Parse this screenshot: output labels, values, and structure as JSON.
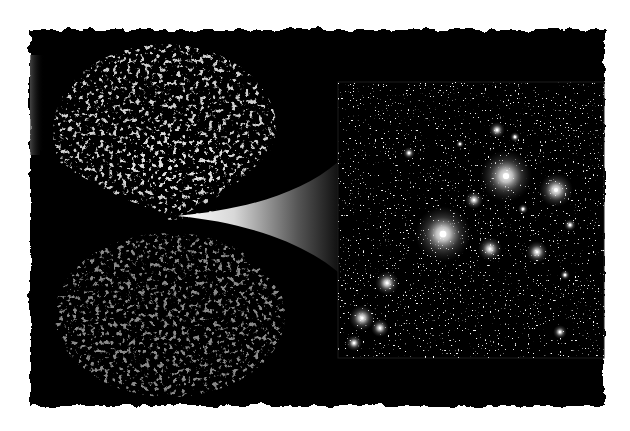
{
  "colors": {
    "page_background": "#ffffff",
    "panel_background": "#000000",
    "cluster_frame": "#1a1a1a",
    "filament": "#bdbdbd",
    "galaxy_glow": "#ffffff",
    "cone_bright": "#ffffff",
    "cone_dark": "#111111"
  },
  "panel": {
    "description": "Torn-edge black panel",
    "bounds": [
      28,
      28,
      606,
      408
    ]
  },
  "survey_wedges": {
    "description": "Galaxy redshift survey slices (two lobes of cosmic web filaments)",
    "upper_lobe": {
      "cx": 165,
      "cy": 140,
      "rx": 120,
      "ry": 90
    },
    "lower_lobe": {
      "cx": 165,
      "cy": 320,
      "rx": 120,
      "ry": 85
    },
    "vertex": [
      178,
      216
    ]
  },
  "zoom_cone": {
    "description": "White-to-black gradient cone linking survey vertex to cluster inset",
    "tip": [
      178,
      216
    ],
    "top_end": [
      335,
      166
    ],
    "bottom_end": [
      335,
      270
    ]
  },
  "cluster_inset": {
    "description": "Galaxy cluster image",
    "bounds": [
      338,
      82,
      604,
      358
    ]
  },
  "bright_galaxies": [
    {
      "x": 506,
      "y": 176,
      "r": 26
    },
    {
      "x": 443,
      "y": 234,
      "r": 28
    },
    {
      "x": 556,
      "y": 190,
      "r": 17
    },
    {
      "x": 490,
      "y": 249,
      "r": 12
    },
    {
      "x": 537,
      "y": 252,
      "r": 11
    },
    {
      "x": 387,
      "y": 283,
      "r": 12
    },
    {
      "x": 362,
      "y": 318,
      "r": 13
    },
    {
      "x": 380,
      "y": 328,
      "r": 9
    },
    {
      "x": 354,
      "y": 343,
      "r": 8
    },
    {
      "x": 497,
      "y": 130,
      "r": 8
    },
    {
      "x": 474,
      "y": 200,
      "r": 9
    },
    {
      "x": 409,
      "y": 153,
      "r": 6
    },
    {
      "x": 560,
      "y": 332,
      "r": 7
    },
    {
      "x": 515,
      "y": 137,
      "r": 5
    },
    {
      "x": 570,
      "y": 225,
      "r": 6
    },
    {
      "x": 565,
      "y": 275,
      "r": 5
    },
    {
      "x": 460,
      "y": 144,
      "r": 4
    },
    {
      "x": 523,
      "y": 209,
      "r": 5
    }
  ]
}
